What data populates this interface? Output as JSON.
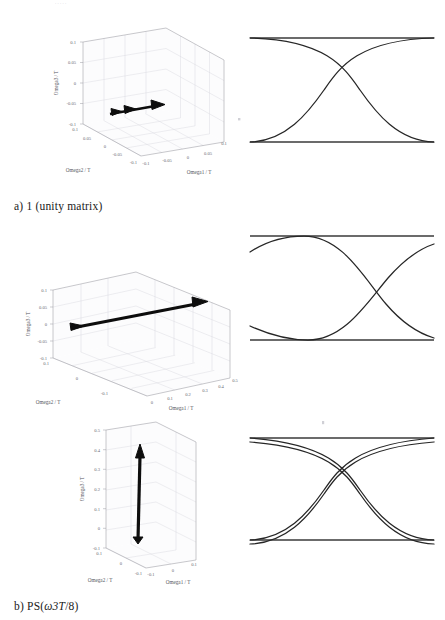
{
  "figure": {
    "top_partial_text": ". .  .  .   .",
    "rows": [
      {
        "caption": "a) 1 (unity matrix)",
        "caption_parts": {
          "index": "a)",
          "label": "1 (unity matrix)"
        },
        "plot": {
          "type": "3d-vector",
          "xlabel": "Omega1 / T",
          "ylabel": "Omega2 / T",
          "zlabel": "Omega3 / T",
          "xticks": [
            "-0.1",
            "-0.05",
            "0",
            "0.05",
            "0.1"
          ],
          "yticks": [
            "-0.1",
            "-0.05",
            "0",
            "0.05",
            "0.1"
          ],
          "zticks": [
            "-0.1",
            "-0.05",
            "0",
            "0.05",
            "0.1"
          ],
          "xlim": [
            -0.1,
            0.1
          ],
          "ylim": [
            -0.1,
            0.1
          ],
          "zlim": [
            -0.1,
            0.1
          ],
          "vector": {
            "x": 0.05,
            "y": 0.0,
            "z": 0.0,
            "description": "short arrow along Omega1"
          }
        },
        "eye": {
          "type": "eye-diagram",
          "shape": "open-eye",
          "crossing_position": "center",
          "rails": 2,
          "traces": 2
        }
      },
      {
        "caption": "b) PS(ω3T/8)",
        "caption_parts": {
          "index": "b)",
          "label": "PS(ω3T/8)"
        },
        "plot": {
          "type": "3d-vector",
          "xlabel": "Omega1 / T",
          "ylabel": "Omega2 / T",
          "zlabel": "Omega3 / T",
          "xticks": [
            "0",
            "0.1",
            "0.2",
            "0.3",
            "0.4",
            "0.5"
          ],
          "yticks": [
            "-0.1",
            "0",
            "0.1"
          ],
          "zticks": [
            "-0.1",
            "-0.05",
            "0",
            "0.05",
            "0.1"
          ],
          "xlim": [
            0,
            0.5
          ],
          "ylim": [
            -0.1,
            0.1
          ],
          "zlim": [
            -0.1,
            0.1
          ],
          "vector": {
            "x": 0.5,
            "y": 0.0,
            "z": 0.0,
            "description": "long arrow along Omega1"
          }
        },
        "eye": {
          "type": "eye-diagram",
          "shape": "shifted-eye",
          "crossing_position": "right-of-center",
          "rails": 2,
          "traces": 2
        }
      },
      {
        "caption": "c) PS(ω3T/8)MC(π/2)",
        "caption_parts": {
          "index": "c)",
          "label": "PS(ω3T/8)MC(π/2)"
        },
        "plot": {
          "type": "3d-vector",
          "xlabel": "Omega1 / T",
          "ylabel": "Omega2 / T",
          "zlabel": "Omega3 / T",
          "xticks": [
            "-0.1",
            "0",
            "0.1"
          ],
          "yticks": [
            "-0.1",
            "0",
            "0.1"
          ],
          "zticks": [
            "-0.1",
            "0",
            "0.1",
            "0.2",
            "0.3",
            "0.4",
            "0.5"
          ],
          "xlim": [
            -0.1,
            0.1
          ],
          "ylim": [
            -0.1,
            0.1
          ],
          "zlim": [
            -0.1,
            0.5
          ],
          "vector": {
            "x": 0.0,
            "y": 0.0,
            "z": 0.4,
            "description": "vertical arrow along Omega3"
          }
        },
        "eye": {
          "type": "eye-diagram",
          "shape": "double-trace-eye",
          "crossing_position": "center-near-rails",
          "rails": 2,
          "traces": 4
        }
      }
    ]
  },
  "colors": {
    "trace": "#262626",
    "rail": "#3a3a3a",
    "axis": "#9a9aa2",
    "grid": "#d9d9e0",
    "vector": "#0d0d0d",
    "text": "#1a1a1a"
  }
}
